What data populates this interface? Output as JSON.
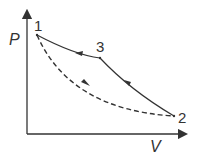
{
  "diagram": {
    "axes": {
      "y_label": "P",
      "x_label": "V"
    },
    "points": [
      {
        "id": "1",
        "x": 37,
        "y": 35
      },
      {
        "id": "3",
        "x": 100,
        "y": 58
      },
      {
        "id": "2",
        "x": 174,
        "y": 116
      }
    ],
    "paths": [
      {
        "from": "1",
        "to": "2",
        "style": "dashed",
        "direction": "1→2"
      },
      {
        "from": "2",
        "to": "3",
        "style": "solid",
        "direction": "2→3"
      },
      {
        "from": "3",
        "to": "1",
        "style": "solid",
        "direction": "3→1"
      }
    ],
    "colors": {
      "line": "#333333",
      "background": "#ffffff"
    }
  }
}
